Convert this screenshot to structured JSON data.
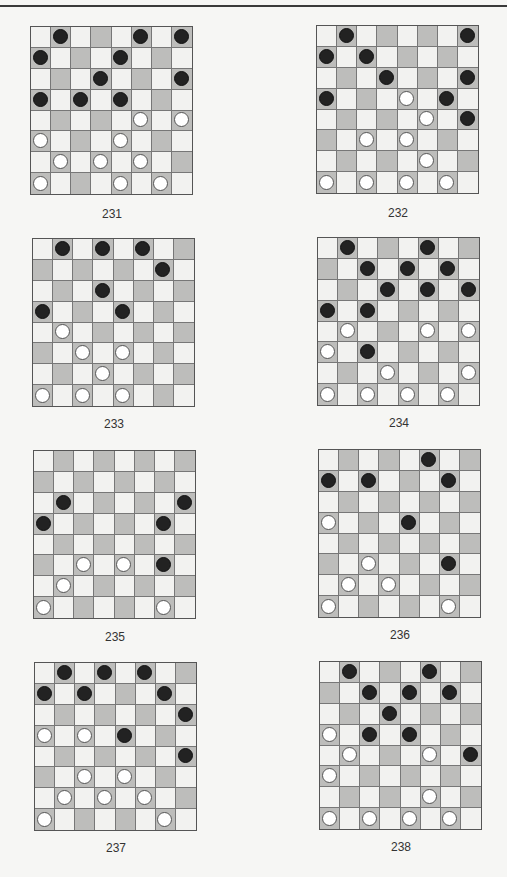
{
  "page": {
    "diagrams": [
      {
        "number": "231",
        "black": [
          [
            0,
            1
          ],
          [
            0,
            5
          ],
          [
            0,
            7
          ],
          [
            1,
            0
          ],
          [
            1,
            4
          ],
          [
            2,
            3
          ],
          [
            2,
            7
          ],
          [
            3,
            0
          ],
          [
            3,
            2
          ],
          [
            3,
            4
          ]
        ],
        "white": [
          [
            4,
            5
          ],
          [
            4,
            7
          ],
          [
            5,
            0
          ],
          [
            5,
            4
          ],
          [
            6,
            1
          ],
          [
            6,
            3
          ],
          [
            6,
            5
          ],
          [
            7,
            0
          ],
          [
            7,
            4
          ],
          [
            7,
            6
          ]
        ]
      },
      {
        "number": "232",
        "black": [
          [
            0,
            1
          ],
          [
            0,
            7
          ],
          [
            1,
            0
          ],
          [
            1,
            2
          ],
          [
            2,
            3
          ],
          [
            2,
            7
          ],
          [
            3,
            0
          ],
          [
            3,
            6
          ],
          [
            4,
            7
          ]
        ],
        "white": [
          [
            3,
            4
          ],
          [
            4,
            5
          ],
          [
            5,
            2
          ],
          [
            5,
            4
          ],
          [
            6,
            5
          ],
          [
            7,
            0
          ],
          [
            7,
            2
          ],
          [
            7,
            4
          ],
          [
            7,
            6
          ]
        ]
      },
      {
        "number": "233",
        "black": [
          [
            0,
            1
          ],
          [
            0,
            3
          ],
          [
            0,
            5
          ],
          [
            1,
            6
          ],
          [
            2,
            3
          ],
          [
            3,
            0
          ],
          [
            3,
            4
          ]
        ],
        "white": [
          [
            4,
            1
          ],
          [
            5,
            2
          ],
          [
            5,
            4
          ],
          [
            6,
            3
          ],
          [
            7,
            0
          ],
          [
            7,
            2
          ],
          [
            7,
            4
          ]
        ]
      },
      {
        "number": "234",
        "black": [
          [
            0,
            1
          ],
          [
            0,
            5
          ],
          [
            1,
            2
          ],
          [
            1,
            4
          ],
          [
            1,
            6
          ],
          [
            2,
            3
          ],
          [
            2,
            5
          ],
          [
            2,
            7
          ],
          [
            3,
            0
          ],
          [
            3,
            2
          ],
          [
            5,
            2
          ]
        ],
        "white": [
          [
            4,
            1
          ],
          [
            4,
            5
          ],
          [
            4,
            7
          ],
          [
            5,
            0
          ],
          [
            6,
            3
          ],
          [
            6,
            7
          ],
          [
            7,
            0
          ],
          [
            7,
            2
          ],
          [
            7,
            4
          ],
          [
            7,
            6
          ]
        ]
      },
      {
        "number": "235",
        "black": [
          [
            2,
            1
          ],
          [
            2,
            7
          ],
          [
            3,
            0
          ],
          [
            3,
            6
          ],
          [
            5,
            6
          ]
        ],
        "white": [
          [
            5,
            2
          ],
          [
            5,
            4
          ],
          [
            6,
            1
          ],
          [
            7,
            0
          ],
          [
            7,
            6
          ]
        ]
      },
      {
        "number": "236",
        "black": [
          [
            0,
            5
          ],
          [
            1,
            0
          ],
          [
            1,
            2
          ],
          [
            1,
            6
          ],
          [
            3,
            4
          ],
          [
            5,
            6
          ]
        ],
        "white": [
          [
            3,
            0
          ],
          [
            5,
            2
          ],
          [
            6,
            1
          ],
          [
            6,
            3
          ],
          [
            7,
            0
          ],
          [
            7,
            6
          ]
        ]
      },
      {
        "number": "237",
        "black": [
          [
            0,
            1
          ],
          [
            0,
            3
          ],
          [
            0,
            5
          ],
          [
            1,
            0
          ],
          [
            1,
            2
          ],
          [
            1,
            6
          ],
          [
            2,
            7
          ],
          [
            3,
            4
          ],
          [
            4,
            7
          ]
        ],
        "white": [
          [
            3,
            0
          ],
          [
            3,
            2
          ],
          [
            5,
            2
          ],
          [
            5,
            4
          ],
          [
            6,
            1
          ],
          [
            6,
            3
          ],
          [
            6,
            5
          ],
          [
            7,
            0
          ],
          [
            7,
            6
          ]
        ]
      },
      {
        "number": "238",
        "black": [
          [
            0,
            1
          ],
          [
            0,
            5
          ],
          [
            1,
            2
          ],
          [
            1,
            4
          ],
          [
            1,
            6
          ],
          [
            2,
            3
          ],
          [
            3,
            2
          ],
          [
            3,
            4
          ],
          [
            4,
            7
          ]
        ],
        "white": [
          [
            3,
            0
          ],
          [
            4,
            1
          ],
          [
            4,
            5
          ],
          [
            5,
            0
          ],
          [
            6,
            5
          ],
          [
            7,
            0
          ],
          [
            7,
            2
          ],
          [
            7,
            4
          ],
          [
            7,
            6
          ]
        ]
      }
    ]
  }
}
